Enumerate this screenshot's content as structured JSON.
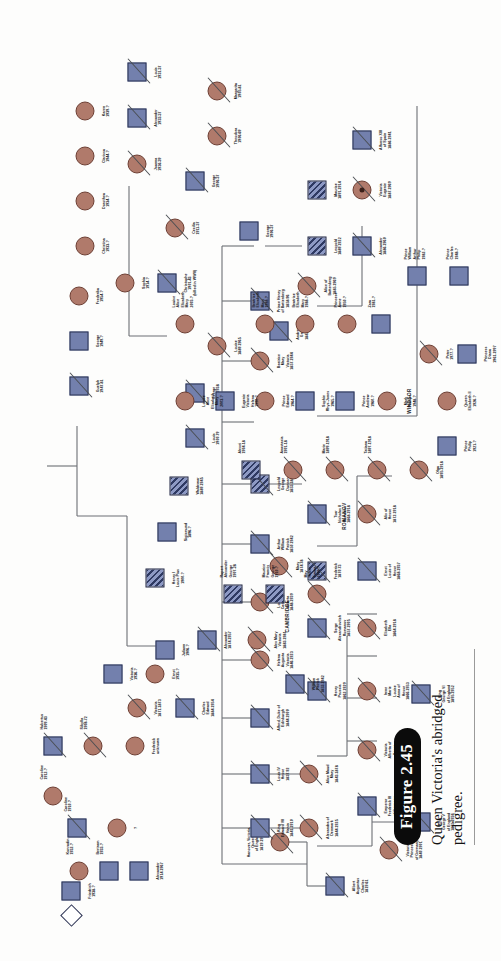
{
  "figure": {
    "number": "Figure 2.45",
    "caption": "Queen Victoria's abridged pedigree."
  },
  "group_labels": [
    {
      "id": "cambridge",
      "text": "CAMBRIDGE"
    },
    {
      "id": "romanov",
      "text": "ROMANOV"
    },
    {
      "id": "windsor",
      "text": "WINDSOR"
    }
  ],
  "legend_meaning": {
    "male": "square",
    "female": "circle",
    "unknown_sex": "diamond",
    "affected_hemophilia": "hatched-fill",
    "deceased": "diagonal-slash",
    "square_color": "#7380ad",
    "circle_color": "#b07a6b",
    "line_color": "#6c6f74"
  },
  "individuals": [
    {
      "id": "albert",
      "name": "Albert\nAugustus\nCharles\n1819-61",
      "sex": "male",
      "deceased": true,
      "affected": false
    },
    {
      "id": "victoria-queen",
      "name": "Hanover, Victoria,\nQueen\nof England\n1819-1901",
      "sex": "female",
      "deceased": true,
      "affected": false
    },
    {
      "id": "edward7",
      "name": "King\nEdward VII\nHanin\n1841-1910",
      "sex": "male",
      "deceased": true,
      "affected": false
    },
    {
      "id": "alexandra-dk",
      "name": "Alexandra of\nDenmark\n1844-1925",
      "sex": "female",
      "deceased": true,
      "affected": false
    },
    {
      "id": "alice-maud",
      "name": "Alice Maud\nMary\n1843-1878",
      "sex": "female",
      "deceased": true,
      "affected": false
    },
    {
      "id": "louis-hesse",
      "name": "Louis IV\nHesse\n1837-92",
      "sex": "male",
      "deceased": true,
      "affected": false
    },
    {
      "id": "alfred-edin",
      "name": "Alfred, Duke of\nEdinburgh\n1844-1900",
      "sex": "male",
      "deceased": true,
      "affected": false
    },
    {
      "id": "helena-aug",
      "name": "Helena\nAugusta\nVictoria\n1846-1923",
      "sex": "female",
      "deceased": true,
      "affected": false
    },
    {
      "id": "louise-car",
      "name": "Louise\nCaroline\nAlberta\n1848-1939",
      "sex": "female",
      "deceased": true,
      "affected": false
    },
    {
      "id": "arthur-wil",
      "name": "Arthur\nWilliam\nPatrick\n1850-1942",
      "sex": "male",
      "deceased": true,
      "affected": false
    },
    {
      "id": "leopold",
      "name": "Leopold\nGeorge\nDuncan\n1853-1884",
      "sex": "male",
      "deceased": true,
      "affected": true
    },
    {
      "id": "beatrice",
      "name": "Beatrice\nMary\nVictoria\n1857-1944",
      "sex": "female",
      "deceased": true,
      "affected": false
    },
    {
      "id": "prince-henry-bat",
      "name": "Prince Henry\nof Battenberg\n1858-96",
      "sex": "male",
      "deceased": true,
      "affected": false
    },
    {
      "id": "victoria-germany",
      "name": "Victoria\nPrincess\nof Germany\n1840-1901",
      "sex": "female",
      "deceased": true,
      "affected": false
    },
    {
      "id": "frederick3",
      "name": "Emperor\nFrederick III\nof Germany\n1831-88",
      "sex": "male",
      "deceased": true,
      "affected": false
    },
    {
      "id": "victoria-alberta",
      "name": "Victoria\nAlberta of\nHesse\n1863-1950",
      "sex": "female",
      "deceased": true,
      "affected": false
    },
    {
      "id": "irene-marie",
      "name": "Irene\nMarie\nLouise\nAnna of\nHesse\n1866-1953",
      "sex": "female",
      "deceased": true,
      "affected": false
    },
    {
      "id": "henry-prussia",
      "name": "Henry\nPrussia\n1862-1929",
      "sex": "male",
      "deceased": true,
      "affected": false
    },
    {
      "id": "elizabeth-ella",
      "name": "Elizabeth\nElla\n1864-1918",
      "sex": "female",
      "deceased": true,
      "affected": false
    },
    {
      "id": "serge-romanov",
      "name": "Serge\nAlexandrovitch\nRomanov\n1857-1905",
      "sex": "male",
      "deceased": true,
      "affected": false
    },
    {
      "id": "ernst-louis",
      "name": "Ernst\nLouis of\nHesse\n1868-1937",
      "sex": "male",
      "deceased": true,
      "affected": false
    },
    {
      "id": "frederick-hesse",
      "name": "Frederick\n1870-73",
      "sex": "male",
      "deceased": true,
      "affected": true
    },
    {
      "id": "alix-hesse",
      "name": "Alix of\nHesse\n1872-1918",
      "sex": "female",
      "deceased": true,
      "affected": false
    },
    {
      "id": "nicholas2",
      "name": "Tsar\nNicholas II\nRomanov\n1868-1918",
      "sex": "male",
      "deceased": true,
      "affected": false
    },
    {
      "id": "alex-mary-vic",
      "name": "Alex Mary\nVictoria\n1883-1981",
      "sex": "female",
      "deceased": true,
      "affected": false
    },
    {
      "id": "alexander-cambridge",
      "name": "Alexander\n1874-1957",
      "sex": "male",
      "deceased": true,
      "affected": false
    },
    {
      "id": "mary-1874",
      "name": "Mary\n1874-78",
      "sex": "female",
      "deceased": true,
      "affected": false
    },
    {
      "id": "william-patrick",
      "name": "William\nPatrick\n1853-1942",
      "sex": "male",
      "deceased": true,
      "affected": false
    },
    {
      "id": "charles-edward",
      "name": "Charles\nEdward\n1884-1954",
      "sex": "male",
      "deceased": true,
      "affected": false
    },
    {
      "id": "victoria-1871",
      "name": "Victoria\n1871-1873",
      "sex": "female",
      "deceased": true,
      "affected": false
    },
    {
      "id": "margarita",
      "name": "Margarita\n1905-81",
      "sex": "female",
      "deceased": true,
      "affected": false
    },
    {
      "id": "theodora",
      "name": "Theodora\n1906-69",
      "sex": "female",
      "deceased": true,
      "affected": false
    },
    {
      "id": "george-1906",
      "name": "George\n1906-37",
      "sex": "male",
      "deceased": true,
      "affected": false
    },
    {
      "id": "cecilia",
      "name": "Cecilia\n1911-37",
      "sex": "female",
      "deceased": true,
      "affected": false
    },
    {
      "id": "christophe",
      "name": "Christophe\n1901-43\n(killed in WWII)",
      "sex": "male",
      "deceased": true,
      "affected": false
    },
    {
      "id": "sophia",
      "name": "Sophia\n1914-?",
      "sex": "female",
      "deceased": false,
      "affected": false
    },
    {
      "id": "louise-1889",
      "name": "Louise\n1889-1965",
      "sex": "female",
      "deceased": true,
      "affected": false
    },
    {
      "id": "george-1892",
      "name": "George\n1892-1938",
      "sex": "male",
      "deceased": true,
      "affected": false
    },
    {
      "id": "louis-1900",
      "name": "Louis\n1900-79",
      "sex": "male",
      "deceased": true,
      "affected": false
    },
    {
      "id": "waldemar",
      "name": "Waldemar\n1889-1945",
      "sex": "male",
      "deceased": true,
      "affected": true
    },
    {
      "id": "sigismund",
      "name": "Sigismund\n1896-?",
      "sex": "male",
      "deceased": false,
      "affected": false
    },
    {
      "id": "henry-louis",
      "name": "Henry I\nLouis Pius\n1900-?",
      "sex": "male",
      "deceased": false,
      "affected": true
    },
    {
      "id": "andrew-greece",
      "name": "Andrew of\nGreece\n1882-1944",
      "sex": "male",
      "deceased": true,
      "affected": false
    },
    {
      "id": "alice-batt",
      "name": "Alice of\nBattenberg\n1885-1969",
      "sex": "female",
      "deceased": true,
      "affected": false
    },
    {
      "id": "george-1935",
      "name": "George\n1906-37",
      "sex": "male",
      "deceased": true,
      "affected": false
    },
    {
      "id": "joanna",
      "name": "Joanna\n1936-39",
      "sex": "female",
      "deceased": true,
      "affected": false
    },
    {
      "id": "alexander-1933",
      "name": "Alexander\n1933-37",
      "sex": "male",
      "deceased": true,
      "affected": false
    },
    {
      "id": "louis-1931",
      "name": "Louis\n1931-37",
      "sex": "male",
      "deceased": true,
      "affected": false
    },
    {
      "id": "christina",
      "name": "Christina\n1933-?",
      "sex": "female",
      "deceased": false,
      "affected": false
    },
    {
      "id": "dorothea",
      "name": "Dorothea\n1934-?",
      "sex": "female",
      "deceased": false,
      "affected": false
    },
    {
      "id": "clarissa",
      "name": "Clarissa\n1944-?",
      "sex": "female",
      "deceased": false,
      "affected": false
    },
    {
      "id": "karen",
      "name": "Karen\n1939-?",
      "sex": "female",
      "deceased": false,
      "affected": false
    },
    {
      "id": "guelph",
      "name": "Guelph\n1947-81",
      "sex": "male",
      "deceased": true,
      "affected": false
    },
    {
      "id": "george-1947",
      "name": "George\n1949-?",
      "sex": "male",
      "deceased": false,
      "affected": false
    },
    {
      "id": "frederika",
      "name": "Frederika\n1954-?",
      "sex": "female",
      "deceased": false,
      "affected": false
    },
    {
      "id": "king-george5",
      "name": "King\nGeorge V\nof England\n1865-1936",
      "sex": "male",
      "deceased": true,
      "affected": false
    },
    {
      "id": "king-george6",
      "name": "King\nGeorge VI\nof England\n1895-1952",
      "sex": "male",
      "deceased": true,
      "affected": false
    },
    {
      "id": "olga",
      "name": "Olga\n1895-1918",
      "sex": "female",
      "deceased": true,
      "affected": false
    },
    {
      "id": "tatiana",
      "name": "Tatiana\n1897-1918",
      "sex": "female",
      "deceased": true,
      "affected": false
    },
    {
      "id": "marie",
      "name": "Marie\n1899-1918",
      "sex": "female",
      "deceased": true,
      "affected": false
    },
    {
      "id": "anastasia",
      "name": "Anastasia\n1901-18",
      "sex": "female",
      "deceased": true,
      "affected": false
    },
    {
      "id": "alexei",
      "name": "Alexei\n1904-18",
      "sex": "male",
      "deceased": true,
      "affected": true
    },
    {
      "id": "may-helen",
      "name": "May\nHelen\nEmma\n1906-?",
      "sex": "female",
      "deceased": false,
      "affected": false
    },
    {
      "id": "maurice-francis",
      "name": "Maurice\nFrancis\nGeorge\n1910-?",
      "sex": "male",
      "deceased": false,
      "affected": true
    },
    {
      "id": "rupert-alexander",
      "name": "Rupert\nAlexander\nGeorge\n1907-28",
      "sex": "male",
      "deceased": true,
      "affected": true
    },
    {
      "id": "juliann",
      "name": "Juliann\n1906-?",
      "sex": "male",
      "deceased": false,
      "affected": false
    },
    {
      "id": "leopold-batt",
      "name": "Leopold\n1889-1922",
      "sex": "male",
      "deceased": true,
      "affected": true
    },
    {
      "id": "alexander-batt",
      "name": "Alexander\n1886-1960",
      "sex": "male",
      "deceased": true,
      "affected": false
    },
    {
      "id": "maurice-batt",
      "name": "Maurice\n1891-1914",
      "sex": "male",
      "deceased": true,
      "affected": true
    },
    {
      "id": "victoria-eugenie",
      "name": "Victoria\nEugenie\n1887-1969",
      "sex": "female",
      "deceased": true,
      "affected": false
    },
    {
      "id": "alfonso13",
      "name": "Alfonso XIII\nof Spain\n1886-1941",
      "sex": "male",
      "deceased": true,
      "affected": false
    },
    {
      "id": "frederick-unknown",
      "name": "Frederick\nunknown",
      "sex": "female",
      "deceased": false,
      "affected": false
    },
    {
      "id": "sibylla",
      "name": "Sibylla\n1908-72",
      "sex": "female",
      "deceased": true,
      "affected": false
    },
    {
      "id": "hubertus",
      "name": "Hubertus\n1909-43",
      "sex": "male",
      "deceased": true,
      "affected": false
    },
    {
      "id": "caroline-1912",
      "name": "Caroline\n1912-?",
      "sex": "female",
      "deceased": false,
      "affected": false
    },
    {
      "id": "friedrich-1938",
      "name": "Friedrich\n1938-?",
      "sex": "male",
      "deceased": false,
      "affected": false
    },
    {
      "id": "proband-diamond",
      "name": "?",
      "sex": "unknown",
      "deceased": false,
      "affected": false
    },
    {
      "id": "caroline-1910",
      "name": "Caroline\n1910-?",
      "sex": "female",
      "deceased": false,
      "affected": false
    },
    {
      "id": "alexander-1914",
      "name": "Alexander\n1914-1967",
      "sex": "male",
      "deceased": true,
      "affected": false
    },
    {
      "id": "bertram",
      "name": "Bertram\n1933-?",
      "sex": "male",
      "deceased": false,
      "affected": false
    },
    {
      "id": "konradin",
      "name": "Konradin\n1932-?",
      "sex": "male",
      "deceased": false,
      "affected": false
    },
    {
      "id": "victoria-1936",
      "name": "Victoria\n1936-?",
      "sex": "female",
      "deceased": false,
      "affected": false
    },
    {
      "id": "ernst-1935",
      "name": "Ernst\n1935-?",
      "sex": "male",
      "deceased": false,
      "affected": false
    },
    {
      "id": "caroline-1933",
      "name": "Caroline\n1933-?",
      "sex": "female",
      "deceased": false,
      "affected": false
    },
    {
      "id": "peter-1909",
      "name": "Peter\n1909-?",
      "sex": "male",
      "deceased": false,
      "affected": false
    },
    {
      "id": "sarah",
      "name": "Sarah\nFerguson\n1959-?",
      "sex": "female",
      "deceased": false,
      "affected": false
    },
    {
      "id": "prince-edward",
      "name": "Prince\nEdward\n1964-?",
      "sex": "male",
      "deceased": false,
      "affected": false
    },
    {
      "id": "eugenie",
      "name": "Eugenie\nVictoria\nHelena\n1990-?",
      "sex": "female",
      "deceased": false,
      "affected": false
    },
    {
      "id": "beatrice-eliz",
      "name": "Beatrice\nElizabeth\nMary\n1988-?",
      "sex": "female",
      "deceased": false,
      "affected": false
    },
    {
      "id": "louise-alice",
      "name": "Louise\nAlice\nElizabeth\nMary\n2003-?",
      "sex": "female",
      "deceased": false,
      "affected": false
    },
    {
      "id": "sophie-rhys",
      "name": "Sophie\nRhys-Jones\n1965-?",
      "sex": "female",
      "deceased": false,
      "affected": false
    },
    {
      "id": "prince-andrew",
      "name": "Prince\nAndrew\n1960-?",
      "sex": "male",
      "deceased": false,
      "affected": false
    },
    {
      "id": "mark-phillips",
      "name": "Mark\nPhillips\n1948-?",
      "sex": "male",
      "deceased": false,
      "affected": false
    },
    {
      "id": "princess-anne",
      "name": "Princess\nAnne\n1950-?",
      "sex": "female",
      "deceased": false,
      "affected": false
    },
    {
      "id": "zara",
      "name": "Zara\n1981-?",
      "sex": "female",
      "deceased": false,
      "affected": false
    },
    {
      "id": "peter-1977",
      "name": "Peter\n1977-?",
      "sex": "male",
      "deceased": false,
      "affected": false
    },
    {
      "id": "princess-diana",
      "name": "Princess\nDiana\n1961-1997",
      "sex": "female",
      "deceased": true,
      "affected": false
    },
    {
      "id": "prince-charles",
      "name": "Prince\nCharles\n1948-?",
      "sex": "male",
      "deceased": false,
      "affected": false
    },
    {
      "id": "prince-william",
      "name": "Prince\nWilliam\nArthur\nPhilip\n1982-?",
      "sex": "male",
      "deceased": false,
      "affected": false
    },
    {
      "id": "prince-henry",
      "name": "Prince\nHenry\nCharles\nAlbert\n1984-?",
      "sex": "male",
      "deceased": false,
      "affected": false
    },
    {
      "id": "queen-elizabeth2",
      "name": "Queen\nElizabeth II\n1926-?",
      "sex": "female",
      "deceased": false,
      "affected": false
    },
    {
      "id": "prince-philip",
      "name": "Prince\nPhilip\n1921-?",
      "sex": "male",
      "deceased": false,
      "affected": false
    }
  ]
}
